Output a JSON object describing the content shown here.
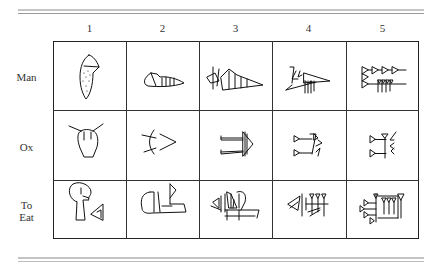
{
  "figure": {
    "column_headers": [
      "1",
      "2",
      "3",
      "4",
      "5"
    ],
    "rows": [
      {
        "label": "Man",
        "signs": [
          "man-stage-1-pictograph",
          "man-stage-2-rotated-pictograph",
          "man-stage-3-early-cuneiform",
          "man-stage-4-cuneiform",
          "man-stage-5-late-cuneiform"
        ]
      },
      {
        "label": "Ox",
        "signs": [
          "ox-stage-1-pictograph",
          "ox-stage-2-rotated-pictograph",
          "ox-stage-3-early-cuneiform",
          "ox-stage-4-cuneiform",
          "ox-stage-5-late-cuneiform"
        ]
      },
      {
        "label_line1": "To",
        "label_line2": "Eat",
        "label": "To Eat",
        "signs": [
          "eat-stage-1-pictograph",
          "eat-stage-2-rotated-pictograph",
          "eat-stage-3-early-cuneiform",
          "eat-stage-4-cuneiform",
          "eat-stage-5-late-cuneiform"
        ]
      }
    ]
  },
  "colors": {
    "ink": "#111111",
    "grid": "#333333",
    "rule": "#b5b5b5",
    "background": "#ffffff"
  }
}
